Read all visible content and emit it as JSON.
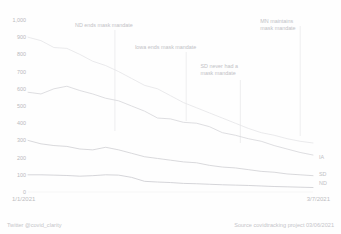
{
  "title": "",
  "footer": {
    "left": "Twitter @covid_clarity",
    "right": "Source covidtracking project 03/06/2021"
  },
  "axis": {
    "x_start_label": "1/1/2021",
    "x_end_label": "3/7/2021",
    "y_ticks": [
      "1,000",
      "900",
      "800",
      "700",
      "600",
      "500",
      "400",
      "300",
      "200",
      "100",
      "0"
    ]
  },
  "annotations": [
    {
      "id": "nd-ends",
      "line1": "ND ends mask mandate",
      "line2": "",
      "x_frac": 0.305,
      "label_left_frac": 0.165,
      "label_top": 22,
      "line_top": 30,
      "line_bottom": 131
    },
    {
      "id": "ia-ends",
      "line1": "Iowa ends mask mandate",
      "line2": "",
      "x_frac": 0.555,
      "label_left_frac": 0.375,
      "label_top": 44,
      "line_top": 52,
      "line_bottom": 121
    },
    {
      "id": "sd-none",
      "line1": "SD never had a",
      "line2": "mask mandate",
      "x_frac": 0.745,
      "label_left_frac": 0.605,
      "label_top": 63,
      "line_top": 80,
      "line_bottom": 143
    },
    {
      "id": "mn-maintains",
      "line1": "MN maintains",
      "line2": "mask mandate",
      "x_frac": 0.955,
      "label_left_frac": 0.815,
      "label_top": 18,
      "line_top": 26,
      "line_bottom": 136
    }
  ],
  "series_labels": [
    {
      "id": "IA",
      "text": "IA",
      "top": 154
    },
    {
      "id": "SD",
      "text": "SD",
      "top": 171
    },
    {
      "id": "ND",
      "text": "ND",
      "top": 180
    }
  ],
  "chart_data": {
    "type": "line",
    "title": "",
    "xlabel": "",
    "ylabel": "",
    "ylim": [
      0,
      1000
    ],
    "grid": false,
    "legend_position": "right-inline",
    "x_start": "1/1/2021",
    "x_end": "3/7/2021",
    "x": [
      "1/1/2021",
      "1/4/2021",
      "1/7/2021",
      "1/10/2021",
      "1/13/2021",
      "1/16/2021",
      "1/19/2021",
      "1/22/2021",
      "1/25/2021",
      "1/28/2021",
      "1/31/2021",
      "2/3/2021",
      "2/6/2021",
      "2/9/2021",
      "2/12/2021",
      "2/15/2021",
      "2/18/2021",
      "2/21/2021",
      "2/24/2021",
      "2/27/2021",
      "3/2/2021",
      "3/5/2021",
      "3/7/2021"
    ],
    "series": [
      {
        "name": "MN",
        "color": "#e6e6e8",
        "values": [
          900,
          880,
          840,
          835,
          800,
          760,
          735,
          700,
          660,
          620,
          600,
          560,
          520,
          490,
          460,
          430,
          400,
          370,
          345,
          330,
          310,
          295,
          285
        ],
        "note": "topmost line, steepest decline"
      },
      {
        "name": "IA",
        "color": "#d8d8dc",
        "values": [
          580,
          570,
          600,
          615,
          590,
          570,
          545,
          530,
          500,
          470,
          430,
          425,
          405,
          400,
          380,
          345,
          330,
          310,
          295,
          270,
          250,
          230,
          215
        ],
        "note": "second line"
      },
      {
        "name": "SD",
        "color": "#d2d2d6",
        "values": [
          300,
          280,
          270,
          265,
          250,
          245,
          260,
          245,
          225,
          205,
          195,
          185,
          175,
          170,
          155,
          145,
          140,
          130,
          120,
          115,
          105,
          100,
          95
        ],
        "note": "third line"
      },
      {
        "name": "ND",
        "color": "#cdcdd2",
        "values": [
          100,
          100,
          98,
          96,
          92,
          95,
          100,
          98,
          85,
          62,
          58,
          55,
          50,
          48,
          45,
          42,
          40,
          38,
          35,
          32,
          30,
          28,
          26
        ],
        "note": "bottom line"
      }
    ]
  }
}
